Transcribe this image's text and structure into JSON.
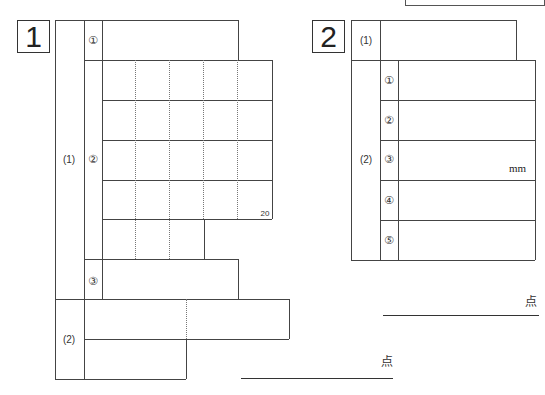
{
  "section1": {
    "number": "1",
    "part1_label": "(1)",
    "part2_label": "(2)",
    "items": [
      "①",
      "②",
      "③"
    ],
    "char_count_marker": "20",
    "score_unit": "点"
  },
  "section2": {
    "number": "2",
    "part1_label": "(1)",
    "part2_label": "(2)",
    "items": [
      "①",
      "②",
      "③",
      "④",
      "⑤"
    ],
    "item3_unit": "mm",
    "score_unit": "点"
  }
}
